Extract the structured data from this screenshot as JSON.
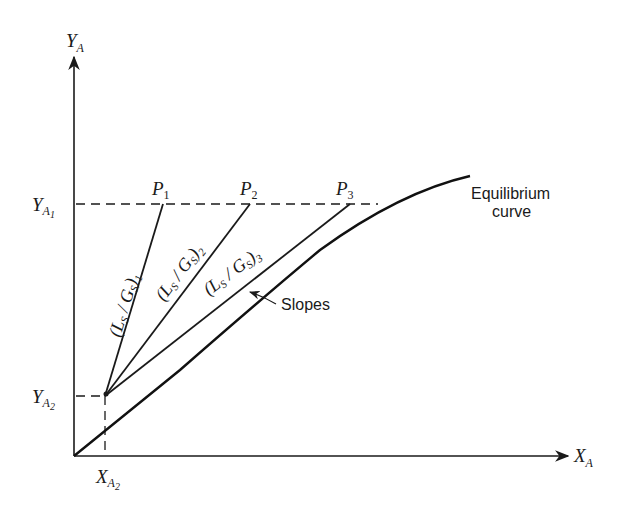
{
  "diagram": {
    "type": "equilibrium-operating-line-diagram",
    "axes": {
      "y_label_main": "Y",
      "y_label_sub": "A",
      "x_label_main": "X",
      "x_label_sub": "A"
    },
    "levels": {
      "y_a1_main": "Y",
      "y_a1_sub": "A",
      "y_a1_subsub": "1",
      "y_a2_main": "Y",
      "y_a2_sub": "A",
      "y_a2_subsub": "2",
      "x_a2_main": "X",
      "x_a2_sub": "A",
      "x_a2_subsub": "2"
    },
    "points": [
      {
        "main": "P",
        "sub": "1"
      },
      {
        "main": "P",
        "sub": "2"
      },
      {
        "main": "P",
        "sub": "3"
      }
    ],
    "operating_lines": [
      {
        "label": "(L",
        "s1": "S",
        "mid": " / G",
        "s2": "S",
        "close": ")",
        "index": "1"
      },
      {
        "label": "(L",
        "s1": "S",
        "mid": " / G",
        "s2": "S",
        "close": ")",
        "index": "2"
      },
      {
        "label": "(L",
        "s1": "S",
        "mid": " / G",
        "s2": "S",
        "close": ")",
        "index": "3"
      }
    ],
    "annotations": {
      "slopes": "Slopes",
      "curve_line1": "Equilibrium",
      "curve_line2": "curve"
    },
    "colors": {
      "ink": "#1a1a1a",
      "background": "#ffffff"
    }
  }
}
